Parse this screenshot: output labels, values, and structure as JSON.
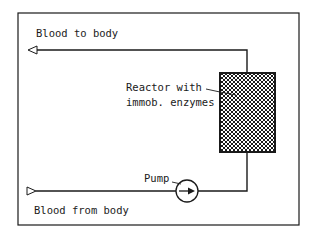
{
  "diagram": {
    "labels": {
      "blood_to_body": "Blood to body",
      "blood_from_body": "Blood from body",
      "reactor_line1": "Reactor with",
      "reactor_line2": "immob. enzymes",
      "pump": "Pump"
    },
    "components": [
      {
        "id": "reactor",
        "type": "packed-bed-reactor",
        "fill": "crosshatch"
      },
      {
        "id": "pump",
        "type": "pump",
        "symbol": "circle-with-arrow"
      }
    ],
    "flows": [
      {
        "from": "body",
        "to": "pump",
        "label": "Blood from body"
      },
      {
        "from": "pump",
        "to": "reactor"
      },
      {
        "from": "reactor",
        "to": "body",
        "label": "Blood to body"
      }
    ],
    "colors": {
      "line": "#1a1a1a",
      "background": "#ffffff"
    }
  }
}
